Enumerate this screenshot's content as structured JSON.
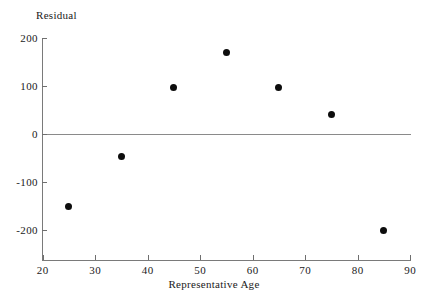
{
  "chart_data": {
    "type": "scatter",
    "title": "",
    "xlabel": "Representative Age",
    "ylabel": "Residual",
    "xlim": [
      20,
      90
    ],
    "ylim": [
      -200,
      200
    ],
    "xticks": [
      20,
      30,
      40,
      50,
      60,
      70,
      80,
      90
    ],
    "yticks": [
      200,
      100,
      0,
      -100,
      -200
    ],
    "xtick_labels": [
      "20",
      "30",
      "40",
      "50",
      "60",
      "70",
      "80",
      "90"
    ],
    "ytick_labels": [
      "200",
      "100",
      "0",
      "-100",
      "-200"
    ],
    "grid": false,
    "legend": null,
    "reference_line": {
      "y": 0,
      "label": "zero-residual-line"
    },
    "x": [
      25,
      35,
      45,
      55,
      65,
      75,
      85
    ],
    "values": [
      -150,
      -47,
      97,
      170,
      97,
      40,
      -201
    ],
    "points": [
      {
        "x": 25,
        "y": -150
      },
      {
        "x": 35,
        "y": -47
      },
      {
        "x": 45,
        "y": 97
      },
      {
        "x": 55,
        "y": 170
      },
      {
        "x": 65,
        "y": 97
      },
      {
        "x": 75,
        "y": 40
      },
      {
        "x": 85,
        "y": -201
      }
    ],
    "marker_color": "#0d0d0d",
    "axis_color": "#7a7a7a"
  }
}
